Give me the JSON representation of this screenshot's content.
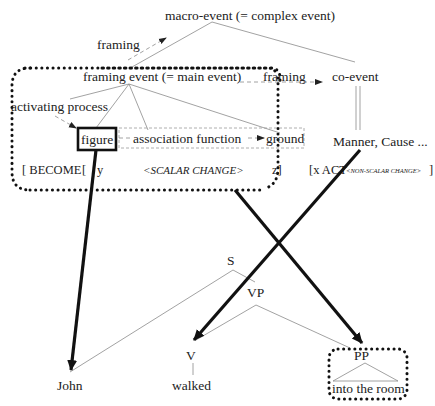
{
  "diagram": {
    "macro_event": "macro-event (= complex event)",
    "framing_top": "framing",
    "framing_event": "framing event (= main event)",
    "framing_right": "framing",
    "co_event": "co-event",
    "activating_process": "activating process",
    "figure": "figure",
    "association_function": "association function",
    "ground": "ground",
    "manner_cause": "Manner, Cause ...",
    "become": "[ BECOME",
    "bracket_open": "[",
    "y": "y",
    "scalar_change": "<SCALAR CHANGE>",
    "z": "z]",
    "x_act": "[x  ACT",
    "non_scalar_change": "<NON-SCALAR CHANGE>",
    "close_bracket": "]"
  },
  "tree": {
    "S": "S",
    "VP": "VP",
    "V": "V",
    "PP": "PP",
    "john": "John",
    "walked": "walked",
    "into_the_room": "into the room"
  }
}
